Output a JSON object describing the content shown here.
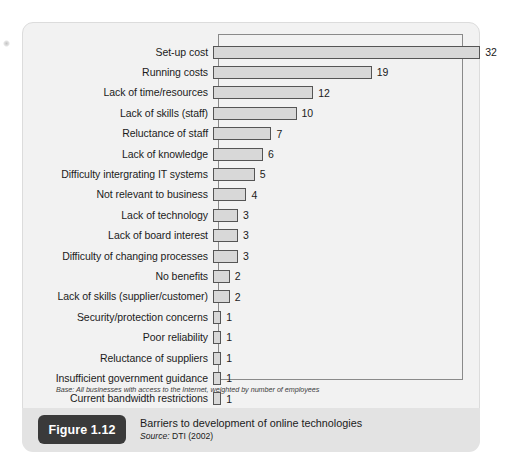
{
  "figure": {
    "badge": "Figure 1.12",
    "title": "Barriers to development of online technologies",
    "source_prefix": "Source:",
    "source_value": " DTI (2002)",
    "base_note": "Base: All businesses with access to the Internet, weighted by number of employees"
  },
  "colors": {
    "bar_fill": "#d8d8d8",
    "bar_stroke": "#555555",
    "card_bg": "#f2f2f2",
    "caption_bg": "#e3e3e3",
    "badge_bg": "#3a3a3a",
    "text": "#1b1b1b"
  },
  "chart_data": {
    "type": "bar",
    "orientation": "horizontal",
    "title": "Barriers to development of online technologies",
    "xlabel": "",
    "ylabel": "",
    "xlim": [
      0,
      34
    ],
    "grid": false,
    "legend": null,
    "source": "DTI (2002)",
    "base_note": "Base: All businesses with access to the Internet, weighted by number of employees",
    "categories": [
      "Set-up cost",
      "Running costs",
      "Lack of time/resources",
      "Lack of skills (staff)",
      "Reluctance of staff",
      "Lack of knowledge",
      "Difficulty intergrating IT systems",
      "Not relevant to business",
      "Lack of technology",
      "Lack of board interest",
      "Difficulty of changing processes",
      "No benefits",
      "Lack of skills (supplier/customer)",
      "Security/protection concerns",
      "Poor reliability",
      "Reluctance of suppliers",
      "Insufficient government guidance",
      "Current bandwidth restrictions"
    ],
    "values": [
      32,
      19,
      12,
      10,
      7,
      6,
      5,
      4,
      3,
      3,
      3,
      2,
      2,
      1,
      1,
      1,
      1,
      1
    ],
    "data_labels": [
      "32",
      "19",
      "12",
      "10",
      "7",
      "6",
      "5",
      "4",
      "3",
      "3",
      "3",
      "2",
      "2",
      "1",
      "1",
      "1",
      "1",
      "1"
    ]
  }
}
